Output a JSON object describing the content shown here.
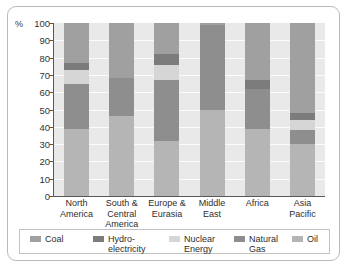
{
  "chart_data": {
    "type": "bar",
    "subtype": "stacked-100",
    "title": "",
    "xlabel": "",
    "ylabel": "%",
    "ylim": [
      0,
      100
    ],
    "ytick_step": 10,
    "yticks": [
      "100",
      "90",
      "80",
      "70",
      "60",
      "50",
      "40",
      "30",
      "20",
      "10",
      "0"
    ],
    "grid": true,
    "legend_position": "bottom",
    "categories": [
      "North\nAmerica",
      "South &\nCentral\nAmerica",
      "Europe &\nEurasia",
      "Middle\nEast",
      "Africa",
      "Asia\nPacific"
    ],
    "series": [
      {
        "name": "Oil",
        "color": "#b5b5b5",
        "values": [
          39,
          46,
          32,
          50,
          39,
          30
        ]
      },
      {
        "name": "Natural Gas",
        "color": "#8e8e8e",
        "values": [
          26,
          22,
          35,
          49,
          23,
          8
        ]
      },
      {
        "name": "Nuclear Energy",
        "color": "#d6d6d6",
        "values": [
          8,
          0,
          9,
          0,
          0,
          6
        ]
      },
      {
        "name": "Hydro-electricity",
        "color": "#7c7c7c",
        "values": [
          4,
          0,
          6,
          0,
          5,
          4
        ]
      },
      {
        "name": "Coal",
        "color": "#a0a0a0",
        "values": [
          23,
          32,
          18,
          1,
          33,
          52
        ]
      }
    ],
    "stack_order_bottom_to_top": [
      "Oil",
      "Natural Gas",
      "Nuclear Energy",
      "Hydro-electricity",
      "Coal"
    ]
  },
  "legend": {
    "items": [
      {
        "label": "Coal",
        "color": "#a0a0a0"
      },
      {
        "label": "Hydro-\nelectricity",
        "color": "#7c7c7c"
      },
      {
        "label": "Nuclear\nEnergy",
        "color": "#d6d6d6"
      },
      {
        "label": "Natural\nGas",
        "color": "#8e8e8e"
      },
      {
        "label": "Oil",
        "color": "#b5b5b5"
      }
    ]
  },
  "colors": {
    "plot_background": "#e9e9e9",
    "gridline": "#fbfbfb",
    "axis": "#58585a",
    "frame": "#b9b9b9",
    "text": "#2e2e2e"
  }
}
